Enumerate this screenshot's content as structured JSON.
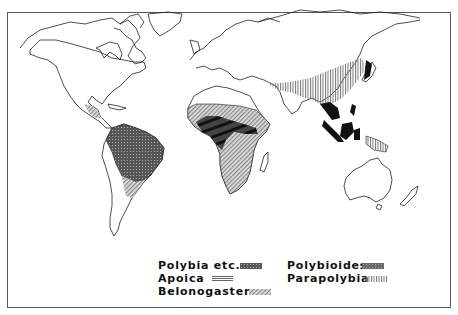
{
  "map": {
    "title": "",
    "regions": [
      {
        "name": "Neotropics (South & Central America)",
        "genus": "Polybia etc."
      },
      {
        "name": "Southern South America fringe",
        "genus": "Belonogaster"
      },
      {
        "name": "Sub-Saharan Africa",
        "genus": "Belonogaster"
      },
      {
        "name": "Central African bands",
        "genus": "Polybioides"
      },
      {
        "name": "East & South Asia",
        "genus": "Parapolybia"
      },
      {
        "name": "Southeast Asia / Indonesia",
        "genus": "Polybioides"
      },
      {
        "name": "New Guinea",
        "genus": "Parapolybia"
      }
    ]
  },
  "legend": {
    "items": [
      {
        "label": "Polybia etc.",
        "pattern": "dense-dots",
        "color": "#444444"
      },
      {
        "label": "Apoica",
        "pattern": "horizontal-lines",
        "color": "#555555"
      },
      {
        "label": "Belonogaster",
        "pattern": "diagonal-lines",
        "color": "#777777"
      },
      {
        "label": "Polybioides",
        "pattern": "solid-dark",
        "color": "#222222"
      },
      {
        "label": "Parapolybia",
        "pattern": "vertical-lines",
        "color": "#666666"
      }
    ]
  }
}
